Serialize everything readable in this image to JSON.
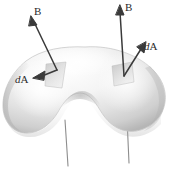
{
  "figure": {
    "kind": "physics-diagram",
    "background_color": "#ffffff",
    "surface": {
      "name": "closed-blob-surface",
      "description": "kidney / bean shaped shaded closed surface",
      "fill_light": "#fdfdfd",
      "fill_mid": "#e4e4e4",
      "fill_shadow": "#b8b8b8",
      "outline_color": "#c9c9c9"
    },
    "vectors": [
      {
        "id": "b-left",
        "label": "B",
        "label_italic_prefix": "",
        "kind": "field-vector",
        "from": [
          57,
          70
        ],
        "to": [
          31,
          17
        ]
      },
      {
        "id": "da-left",
        "label": "A",
        "label_italic_prefix": "d",
        "kind": "area-element-vector",
        "from": [
          57,
          70
        ],
        "to": [
          35,
          77
        ]
      },
      {
        "id": "b-right",
        "label": "B",
        "label_italic_prefix": "",
        "kind": "field-vector",
        "from": [
          124,
          76
        ],
        "to": [
          120,
          6
        ]
      },
      {
        "id": "da-right",
        "label": "A",
        "label_italic_prefix": "d",
        "kind": "area-element-vector",
        "from": [
          124,
          76
        ],
        "to": [
          146,
          43
        ]
      }
    ],
    "field_lines": [
      {
        "id": "field-line-left",
        "x_top": 65,
        "y_top": 127,
        "x_bottom": 68,
        "y_bottom": 166
      },
      {
        "id": "field-line-right",
        "x_top": 127,
        "y_top": 124,
        "x_bottom": 129,
        "y_bottom": 163
      }
    ],
    "patches": [
      {
        "id": "patch-left",
        "cx": 57,
        "cy": 70,
        "note": "shaded area element patch on surface (left)"
      },
      {
        "id": "patch-right",
        "cx": 123,
        "cy": 72,
        "note": "shaded area element patch on surface (right)"
      }
    ],
    "caption_stub": ""
  },
  "colors": {
    "ink": "#2b2b2b",
    "arrow": "#3a3a3a",
    "field_line": "#8d8d8d",
    "surface_outline": "#c9c9c9"
  }
}
